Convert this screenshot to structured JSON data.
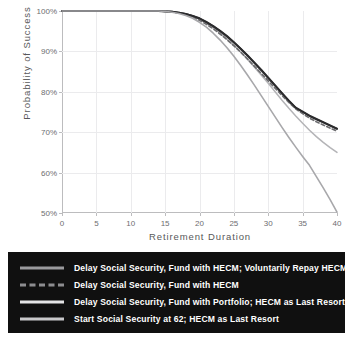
{
  "chart_data": {
    "type": "line",
    "title": "",
    "xlabel": "Retirement Duration",
    "ylabel": "Probability of Success",
    "xlim": [
      0,
      40
    ],
    "ylim": [
      50,
      100
    ],
    "grid": true,
    "legend_position": "below",
    "x_ticks": [
      "0",
      "5",
      "10",
      "15",
      "20",
      "25",
      "30",
      "35",
      "40"
    ],
    "y_ticks": [
      "100%",
      "90%",
      "80%",
      "70%",
      "60%",
      "50%"
    ],
    "x": [
      0,
      2,
      4,
      6,
      8,
      10,
      12,
      14,
      15,
      16,
      17,
      18,
      19,
      20,
      21,
      22,
      23,
      24,
      25,
      26,
      27,
      28,
      29,
      30,
      31,
      32,
      33,
      34,
      35,
      36,
      37,
      38,
      39,
      40
    ],
    "series": [
      {
        "name": "Delay Social Security, Fund with HECM; Voluntarily Repay HECM",
        "style": "solid",
        "color": "#3b3b3d",
        "width": 1.9,
        "values": [
          100,
          100,
          100,
          100,
          100,
          100,
          100,
          100,
          99.9,
          99.8,
          99.6,
          99.3,
          98.8,
          98.1,
          97.2,
          96.2,
          95.0,
          93.7,
          92.2,
          90.6,
          88.9,
          87.1,
          85.3,
          83.4,
          81.5,
          79.6,
          77.7,
          76.0,
          75.0,
          74.0,
          73.2,
          72.4,
          71.6,
          70.8
        ]
      },
      {
        "name": "Delay Social Security, Fund with HECM",
        "style": "dashed",
        "color": "#6c6c6f",
        "width": 1.7,
        "values": [
          100,
          100,
          100,
          100,
          100,
          100,
          100,
          100,
          99.9,
          99.8,
          99.5,
          99.1,
          98.5,
          97.7,
          96.7,
          95.6,
          94.3,
          92.9,
          91.4,
          89.8,
          88.1,
          86.3,
          84.5,
          82.7,
          80.9,
          79.1,
          77.4,
          75.8,
          74.6,
          73.5,
          72.6,
          71.8,
          71.0,
          70.3
        ]
      },
      {
        "name": "Delay Social Security, Fund with Portfolio; HECM as Last Resort",
        "style": "solid",
        "color": "#2b2b2d",
        "width": 1.9,
        "values": [
          100,
          100,
          100,
          100,
          100,
          100,
          100,
          100,
          99.9,
          99.8,
          99.6,
          99.3,
          98.8,
          98.2,
          97.3,
          96.3,
          95.1,
          93.8,
          92.3,
          90.7,
          89.0,
          87.2,
          85.4,
          83.5,
          81.6,
          79.7,
          77.8,
          76.1,
          75.1,
          74.1,
          73.3,
          72.5,
          71.7,
          70.9
        ]
      },
      {
        "name": "Start Social Security at 62; HECM as Last Resort",
        "style": "solid",
        "color": "#a8a8ab",
        "width": 1.6,
        "values": [
          100,
          100,
          100,
          100,
          100,
          100,
          100,
          100,
          99.9,
          99.7,
          99.4,
          98.9,
          98.2,
          97.2,
          96.0,
          94.5,
          92.8,
          90.9,
          88.8,
          86.5,
          84.1,
          81.6,
          79.0,
          76.4,
          73.8,
          71.2,
          68.7,
          66.3,
          64.0,
          61.8,
          59.0,
          56.2,
          53.3,
          50.2
        ]
      }
    ],
    "extra_series": [
      {
        "name": "secondary-lower-branch",
        "style": "solid",
        "color": "#b4b4b7",
        "width": 1.5,
        "values": [
          100,
          100,
          100,
          100,
          100,
          100,
          100,
          100,
          99.9,
          99.8,
          99.6,
          99.2,
          98.7,
          98.0,
          97.0,
          95.9,
          94.6,
          93.1,
          91.5,
          89.8,
          88.0,
          86.1,
          84.1,
          82.1,
          80.0,
          77.9,
          75.9,
          74.0,
          72.2,
          70.5,
          68.9,
          67.5,
          66.2,
          65.0
        ]
      }
    ]
  },
  "legend": {
    "items": [
      {
        "label": "Delay Social Security, Fund with HECM; Voluntarily Repay HECM",
        "style": "solid",
        "color": "#9a9a9d"
      },
      {
        "label": "Delay Social Security, Fund with HECM",
        "style": "dashed",
        "color": "#8d8d90"
      },
      {
        "label": "Delay Social Security, Fund with Portfolio; HECM as Last Resort",
        "style": "solid",
        "color": "#e4e4e6"
      },
      {
        "label": "Start Social Security at 62; HECM as Last Resort",
        "style": "solid",
        "color": "#c8c8cb"
      }
    ]
  }
}
